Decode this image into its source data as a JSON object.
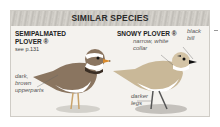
{
  "header": {
    "title": "SIMILAR SPECIES"
  },
  "species": [
    {
      "name_line1": "SEMIPALMATED",
      "name_line2": "PLOVER ®",
      "ref": "see p.131",
      "labels": [
        {
          "line1": "dark,",
          "line2": "brown",
          "line3": "upperparts"
        }
      ]
    },
    {
      "name_line1": "SNOWY PLOVER ®",
      "ref": "",
      "labels": [
        {
          "line1": "black",
          "line2": "bill"
        },
        {
          "line1": "narrow, white",
          "line2": "collar"
        },
        {
          "line1": "darker",
          "line2": "legs"
        }
      ]
    }
  ],
  "colors": {
    "panel_bg": "#f4f2ee",
    "header_bg": "#c9c6c0",
    "border": "#cfccc6"
  }
}
